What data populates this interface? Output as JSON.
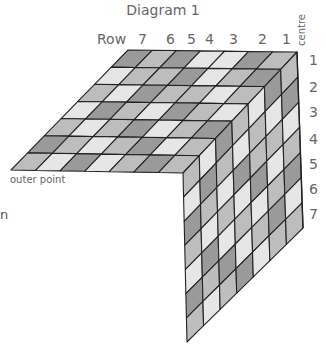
{
  "title": "Diagram 1",
  "row_header": "Row",
  "column_labels": [
    "7",
    "6",
    "5",
    "4",
    "3",
    "2",
    "1"
  ],
  "centre_label": "centre",
  "row_labels": [
    "1",
    "2",
    "3",
    "4",
    "5",
    "6",
    "7"
  ],
  "outer_point_label": "outer point",
  "left_fragment": "n",
  "colors": {
    "line": "#222222",
    "light": "#e6e6e6",
    "mid": "#bdbdbd",
    "dark": "#9a9a9a",
    "text": "#666666"
  },
  "top_shades": [
    [
      2,
      1,
      2,
      0,
      0,
      2,
      1
    ],
    [
      0,
      1,
      1,
      2,
      0,
      1,
      2
    ],
    [
      1,
      0,
      2,
      1,
      1,
      0,
      1
    ],
    [
      0,
      2,
      1,
      0,
      2,
      1,
      0
    ],
    [
      1,
      0,
      1,
      2,
      0,
      1,
      2
    ],
    [
      2,
      1,
      0,
      1,
      2,
      0,
      1
    ],
    [
      1,
      0,
      2,
      0,
      1,
      2,
      1
    ]
  ],
  "side_shades": [
    [
      1,
      0,
      2,
      1,
      0,
      2,
      1
    ],
    [
      0,
      2,
      1,
      0,
      1,
      0,
      2
    ],
    [
      2,
      1,
      0,
      2,
      1,
      1,
      0
    ],
    [
      1,
      0,
      1,
      0,
      2,
      0,
      1
    ],
    [
      0,
      2,
      0,
      1,
      0,
      1,
      2
    ],
    [
      2,
      1,
      2,
      0,
      1,
      2,
      0
    ],
    [
      1,
      0,
      1,
      2,
      0,
      1,
      1
    ]
  ]
}
